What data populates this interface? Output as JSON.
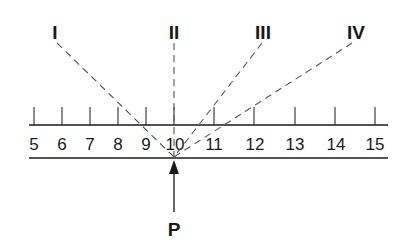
{
  "diagram": {
    "ray_labels": [
      "I",
      "II",
      "III",
      "IV"
    ],
    "scale_numbers": [
      "5",
      "6",
      "7",
      "8",
      "9",
      "10",
      "11",
      "12",
      "13",
      "14",
      "15"
    ],
    "point_label": "P",
    "colors": {
      "ink": "#1a1a1a",
      "dash": "#555555"
    }
  }
}
